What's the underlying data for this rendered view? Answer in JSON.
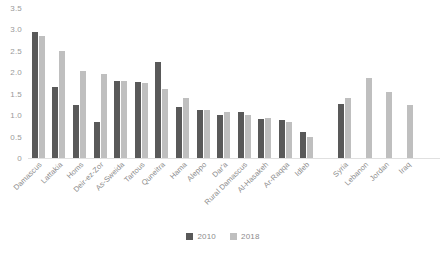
{
  "chart_data": {
    "type": "bar",
    "title": "",
    "subtitle": "",
    "xlabel": "",
    "ylabel": "",
    "ylim": [
      0,
      3.5
    ],
    "yticks": [
      "0",
      "0.5",
      "1.0",
      "1.5",
      "2.0",
      "2.5",
      "3.0",
      "3.5"
    ],
    "ytick_values": [
      0,
      0.5,
      1.0,
      1.5,
      2.0,
      2.5,
      3.0,
      3.5
    ],
    "grid": false,
    "legend_position": "bottom",
    "categories": [
      "Damascus",
      "Lattakia",
      "Homs",
      "Deir-ez-Zor",
      "As-Sweida",
      "Tartous",
      "Quneitra",
      "Hama",
      "Aleppo",
      "Dar'a",
      "Rural Damascus",
      "Al-Hasakeh",
      "Ar-Raqqa",
      "Idleb",
      "Syria",
      "Lebanon",
      "Jordan",
      "Iraq"
    ],
    "group_break_after": "Idleb",
    "series": [
      {
        "name": "2010",
        "color": "#595959",
        "values": [
          2.93,
          1.65,
          1.23,
          0.83,
          1.79,
          1.78,
          2.25,
          1.2,
          1.12,
          1.0,
          1.08,
          0.92,
          0.88,
          0.6,
          1.25,
          null,
          null,
          null
        ]
      },
      {
        "name": "2018",
        "color": "#bfbfbf",
        "values": [
          2.85,
          2.5,
          2.02,
          1.96,
          1.8,
          1.76,
          1.62,
          1.4,
          1.12,
          1.08,
          1.0,
          0.93,
          0.85,
          0.48,
          1.4,
          1.87,
          1.55,
          1.23
        ]
      }
    ]
  },
  "legend": {
    "items": [
      {
        "label": "2010",
        "series": "2010"
      },
      {
        "label": "2018",
        "series": "2018"
      }
    ]
  }
}
